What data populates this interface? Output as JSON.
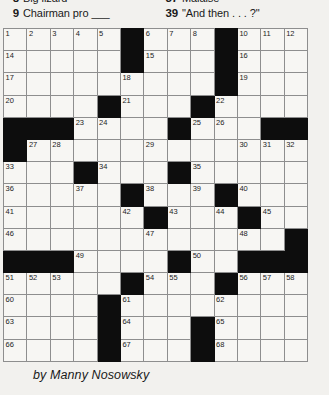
{
  "clues": {
    "left_column": [
      {
        "num": "8",
        "text": "Big lizard"
      },
      {
        "num": "9",
        "text": "Chairman pro ___"
      }
    ],
    "right_column": [
      {
        "num": "37",
        "text": "Malaise"
      },
      {
        "num": "39",
        "text": "\"And then . . . ?\""
      }
    ]
  },
  "byline": "by Manny Nosowsky",
  "grid": {
    "columns": 13,
    "rows": 15,
    "colors": {
      "block": "#0d0d0d",
      "cell": "#f7f6f3",
      "grid_line": "#8e8e8e",
      "border": "#3a3a3a",
      "page": "#f2f1ee"
    },
    "cells": [
      [
        {
          "n": "1"
        },
        {
          "n": "2"
        },
        {
          "n": "3"
        },
        {
          "n": "4"
        },
        {
          "n": "5"
        },
        {
          "b": true
        },
        {
          "n": "6"
        },
        {
          "n": "7"
        },
        {
          "n": "8"
        },
        {
          "b": true
        },
        {
          "n": "10"
        },
        {
          "n": "11"
        },
        {
          "n": "12"
        }
      ],
      [
        {
          "n": "14"
        },
        {},
        {},
        {},
        {},
        {
          "b": true
        },
        {
          "n": "15"
        },
        {},
        {},
        {
          "b": true
        },
        {
          "n": "16"
        },
        {},
        {}
      ],
      [
        {
          "n": "17"
        },
        {},
        {},
        {},
        {},
        {
          "n": "18"
        },
        {},
        {},
        {},
        {
          "b": true
        },
        {
          "n": "19"
        },
        {},
        {}
      ],
      [
        {
          "n": "20"
        },
        {},
        {},
        {},
        {
          "b": true
        },
        {
          "n": "21"
        },
        {},
        {},
        {
          "b": true
        },
        {
          "n": "22"
        },
        {},
        {},
        {}
      ],
      [
        {
          "b": true
        },
        {
          "b": true
        },
        {
          "b": true
        },
        {
          "n": "23"
        },
        {
          "n": "24"
        },
        {},
        {},
        {
          "b": true
        },
        {
          "n": "25"
        },
        {
          "n": "26"
        },
        {},
        {
          "b": true
        },
        {
          "b": true
        }
      ],
      [
        {
          "b": true
        },
        {
          "n": "27"
        },
        {
          "n": "28"
        },
        {},
        {},
        {},
        {
          "n": "29"
        },
        {},
        {},
        {},
        {
          "n": "30"
        },
        {
          "n": "31"
        },
        {
          "n": "32"
        }
      ],
      [
        {
          "n": "33"
        },
        {},
        {},
        {
          "b": true
        },
        {
          "n": "34"
        },
        {},
        {},
        {
          "b": true
        },
        {
          "n": "35"
        },
        {},
        {},
        {},
        {}
      ],
      [
        {
          "n": "36"
        },
        {},
        {},
        {
          "n": "37"
        },
        {},
        {
          "b": true
        },
        {
          "n": "38"
        },
        {},
        {
          "n": "39"
        },
        {
          "b": true
        },
        {
          "n": "40"
        },
        {},
        {}
      ],
      [
        {
          "n": "41"
        },
        {},
        {},
        {},
        {},
        {
          "n": "42"
        },
        {
          "b": true
        },
        {
          "n": "43"
        },
        {},
        {
          "n": "44"
        },
        {
          "b": true
        },
        {
          "n": "45"
        },
        {}
      ],
      [
        {
          "n": "46"
        },
        {},
        {},
        {},
        {},
        {},
        {
          "n": "47"
        },
        {},
        {},
        {},
        {
          "n": "48"
        },
        {},
        {
          "b": true
        }
      ],
      [
        {
          "b": true
        },
        {
          "b": true
        },
        {
          "b": true
        },
        {
          "n": "49"
        },
        {},
        {},
        {},
        {
          "b": true
        },
        {
          "n": "50"
        },
        {},
        {
          "b": true
        },
        {
          "b": true
        },
        {
          "b": true
        }
      ],
      [
        {
          "n": "51"
        },
        {
          "n": "52"
        },
        {
          "n": "53"
        },
        {},
        {},
        {
          "b": true
        },
        {
          "n": "54"
        },
        {
          "n": "55"
        },
        {},
        {
          "b": true
        },
        {
          "n": "56"
        },
        {
          "n": "57"
        },
        {
          "n": "58"
        }
      ],
      [
        {
          "n": "60"
        },
        {},
        {},
        {},
        {
          "b": true
        },
        {
          "n": "61"
        },
        {},
        {},
        {},
        {
          "n": "62"
        },
        {},
        {},
        {}
      ],
      [
        {
          "n": "63"
        },
        {},
        {},
        {},
        {
          "b": true
        },
        {
          "n": "64"
        },
        {},
        {},
        {
          "b": true
        },
        {
          "n": "65"
        },
        {},
        {},
        {}
      ],
      [
        {
          "n": "66"
        },
        {},
        {},
        {},
        {
          "b": true
        },
        {
          "n": "67"
        },
        {},
        {},
        {
          "b": true
        },
        {
          "n": "68"
        },
        {},
        {},
        {}
      ]
    ]
  }
}
